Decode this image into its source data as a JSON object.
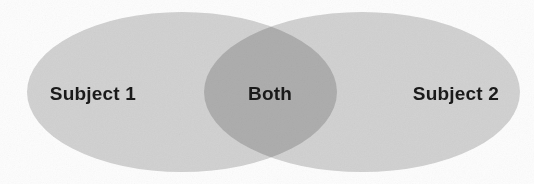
{
  "diagram": {
    "type": "venn",
    "title": "",
    "width": 534,
    "height": 184,
    "background_color": "#fdfdfd",
    "sets": [
      {
        "id": "left",
        "label": "Subject 1",
        "fill_color": "#d4d4d4",
        "label_color": "#1a1a1a",
        "cx": 182,
        "cy": 92,
        "rx": 155,
        "ry": 80,
        "label_x": 93,
        "label_y": 94
      },
      {
        "id": "right",
        "label": "Subject 2",
        "fill_color": "#d4d4d4",
        "label_color": "#1a1a1a",
        "cx": 362,
        "cy": 92,
        "rx": 158,
        "ry": 80,
        "label_x": 456,
        "label_y": 94
      }
    ],
    "intersection": {
      "id": "both",
      "label": "Both",
      "fill_color": "#bdbdbd",
      "label_color": "#1a1a1a",
      "label_x": 270,
      "label_y": 94
    }
  }
}
